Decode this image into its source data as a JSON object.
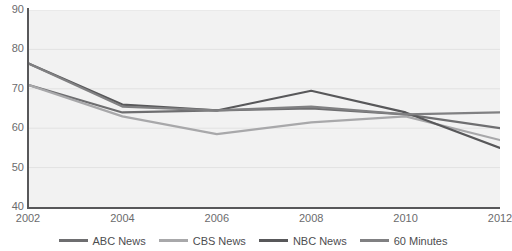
{
  "chart_data": {
    "type": "line",
    "title": "",
    "subtitle": "",
    "xlabel": "",
    "ylabel": "",
    "x": [
      2002,
      2004,
      2006,
      2008,
      2010,
      2012
    ],
    "xtick_labels": [
      "2002",
      "2004",
      "2006",
      "2008",
      "2010",
      "2012"
    ],
    "ytick_labels": [
      "40",
      "50",
      "60",
      "70",
      "80",
      "90"
    ],
    "yticks": [
      40,
      50,
      60,
      70,
      80,
      90
    ],
    "xlim": [
      2002,
      2012
    ],
    "ylim": [
      40,
      90
    ],
    "grid": true,
    "grid_axis": "y",
    "legend_position": "bottom",
    "plot_background": "#f2f2f2",
    "series": [
      {
        "name": "ABC News",
        "color": "#6e6e70",
        "values": [
          71.0,
          64.0,
          64.5,
          65.0,
          63.5,
          60.0
        ]
      },
      {
        "name": "CBS News",
        "color": "#a8a8aa",
        "values": [
          71.0,
          63.0,
          58.5,
          61.5,
          63.0,
          57.0
        ]
      },
      {
        "name": "NBC News",
        "color": "#58585a",
        "values": [
          76.5,
          66.0,
          64.5,
          69.5,
          64.0,
          55.0
        ]
      },
      {
        "name": "60 Minutes",
        "color": "#808082",
        "values": [
          76.5,
          65.5,
          64.5,
          65.5,
          63.5,
          64.0
        ]
      }
    ]
  },
  "legend": {
    "items": [
      {
        "label": "ABC News",
        "color": "#6e6e70"
      },
      {
        "label": "CBS News",
        "color": "#a8a8aa"
      },
      {
        "label": "NBC News",
        "color": "#58585a"
      },
      {
        "label": "60 Minutes",
        "color": "#808082"
      }
    ]
  }
}
